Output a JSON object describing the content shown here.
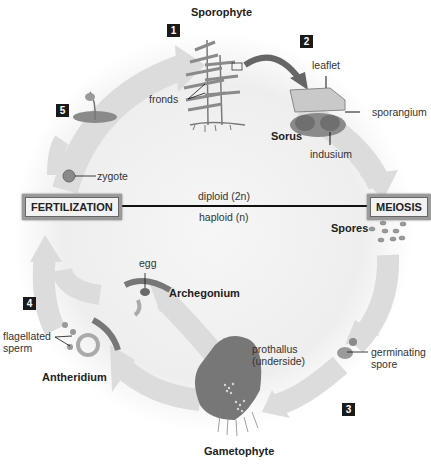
{
  "diagram": {
    "title": "Sporophyte",
    "bottom_title": "Gametophyte",
    "step_numbers": [
      "1",
      "2",
      "3",
      "4",
      "5"
    ],
    "stages": {
      "left": "FERTILIZATION",
      "right": "MEIOSIS"
    },
    "divider": {
      "above": "diploid (2n)",
      "below": "haploid (n)"
    },
    "labels": {
      "fronds": "fronds",
      "leaflet": "leaflet",
      "sporangium": "sporangium",
      "sorus": "Sorus",
      "indusium": "indusium",
      "zygote": "zygote",
      "spores": "Spores",
      "egg": "egg",
      "archegonium": "Archegonium",
      "flagellated": "flagellated",
      "sperm": "sperm",
      "antheridium": "Antheridium",
      "prothallus": "prothallus",
      "underside": "(underside)",
      "germinating": "germinating",
      "spore": "spore"
    },
    "colors": {
      "arrow": "#d9d9d9",
      "background_gradient": "#ececec",
      "plant": "#8a8a8a",
      "box_border": "#9a9a9a"
    }
  }
}
